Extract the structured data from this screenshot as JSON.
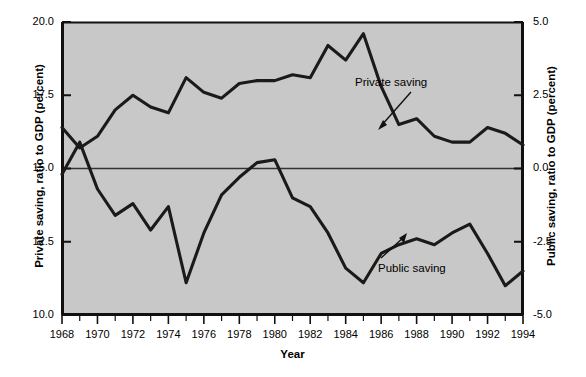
{
  "chart_data": {
    "type": "line",
    "title": "",
    "subtitle": "",
    "xlabel": "Year",
    "ylabel": "Private saving, ratio to GDP (percent)",
    "ylabel_right": "Public saving, ratio to GDP (percent)",
    "xlim": [
      1968,
      1994
    ],
    "ylim": [
      10.0,
      20.0
    ],
    "ylim_right": [
      -5.0,
      5.0
    ],
    "grid": false,
    "legend": "annotations-on-plot",
    "plot_background": "#c8c8c8",
    "line_color": "#1a1a1a",
    "zero_line_value": 0.0,
    "xticks": [
      1968,
      1969,
      1970,
      1971,
      1972,
      1973,
      1974,
      1975,
      1976,
      1977,
      1978,
      1979,
      1980,
      1981,
      1982,
      1983,
      1984,
      1985,
      1986,
      1987,
      1988,
      1989,
      1990,
      1991,
      1992,
      1993,
      1994
    ],
    "xtick_labels": [
      "1968",
      "1970",
      "1972",
      "1974",
      "1976",
      "1978",
      "1980",
      "1982",
      "1984",
      "1986",
      "1988",
      "1990",
      "1992",
      "1994"
    ],
    "xtick_label_years": [
      1968,
      1970,
      1972,
      1974,
      1976,
      1978,
      1980,
      1982,
      1984,
      1986,
      1988,
      1990,
      1992,
      1994
    ],
    "ytick_labels_left": [
      "20.0",
      "17.5",
      "15.0",
      "12.5",
      "10.0"
    ],
    "ytick_values_left": [
      20.0,
      17.5,
      15.0,
      12.5,
      10.0
    ],
    "ytick_labels_right": [
      "5.0",
      "2.5",
      "0.0",
      "-2.5",
      "-5.0"
    ],
    "ytick_values_right": [
      5.0,
      2.5,
      0.0,
      -2.5,
      -5.0
    ],
    "x": [
      1968,
      1969,
      1970,
      1971,
      1972,
      1973,
      1974,
      1975,
      1976,
      1977,
      1978,
      1979,
      1980,
      1981,
      1982,
      1983,
      1984,
      1985,
      1986,
      1987,
      1988,
      1989,
      1990,
      1991,
      1992,
      1993,
      1994
    ],
    "series": [
      {
        "name": "Private saving",
        "axis": "left",
        "annotation": "Private saving",
        "values": [
          16.4,
          15.7,
          16.1,
          17.0,
          17.5,
          17.1,
          16.9,
          18.1,
          17.6,
          17.4,
          17.9,
          18.0,
          18.0,
          18.2,
          18.1,
          19.2,
          18.7,
          19.6,
          17.8,
          16.5,
          16.7,
          16.1,
          15.9,
          15.9,
          16.4,
          16.2,
          15.8
        ]
      },
      {
        "name": "Public saving",
        "axis": "right",
        "annotation": "Public saving",
        "values": [
          -0.2,
          0.9,
          -0.7,
          -1.6,
          -1.2,
          -2.1,
          -1.3,
          -3.9,
          -2.2,
          -0.9,
          -0.3,
          0.2,
          0.3,
          -1.0,
          -1.3,
          -2.2,
          -3.4,
          -3.9,
          -2.9,
          -2.6,
          -2.4,
          -2.6,
          -2.2,
          -1.9,
          -2.9,
          -4.0,
          -3.5
        ]
      }
    ]
  }
}
